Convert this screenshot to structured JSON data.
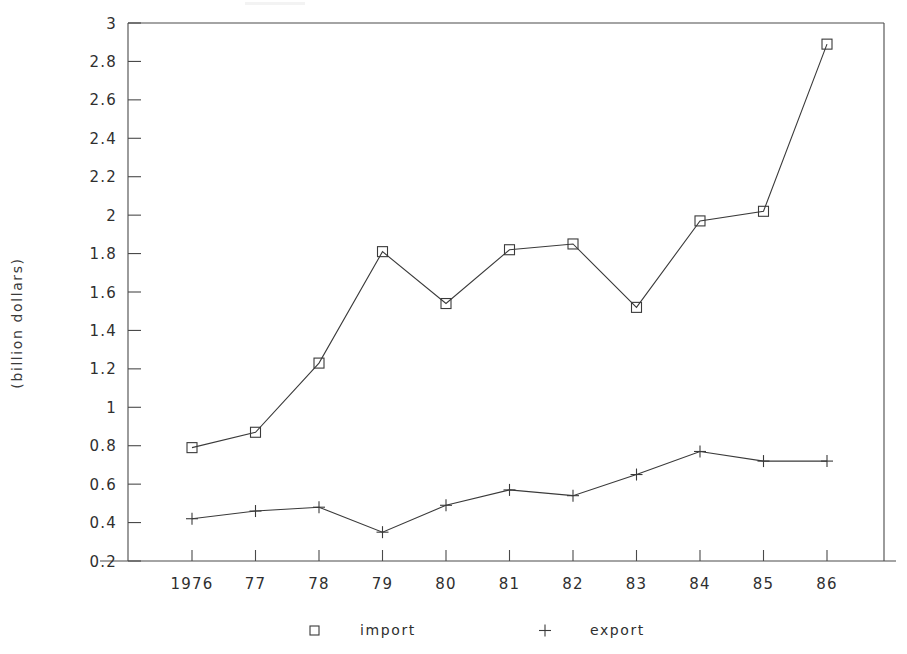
{
  "chart_data": {
    "type": "line",
    "title": "",
    "xlabel": "",
    "ylabel": "(billion dollars)",
    "categories": [
      "1976",
      "77",
      "78",
      "79",
      "80",
      "81",
      "82",
      "83",
      "84",
      "85",
      "86"
    ],
    "x_values": [
      1976,
      1977,
      1978,
      1979,
      1980,
      1981,
      1982,
      1983,
      1984,
      1985,
      1986
    ],
    "series": [
      {
        "name": "import",
        "marker": "square",
        "values": [
          0.79,
          0.87,
          1.23,
          1.81,
          1.54,
          1.82,
          1.85,
          1.52,
          1.97,
          2.02,
          2.89
        ]
      },
      {
        "name": "export",
        "marker": "plus",
        "values": [
          0.42,
          0.46,
          0.48,
          0.35,
          0.49,
          0.57,
          0.54,
          0.65,
          0.77,
          0.72,
          0.72
        ]
      }
    ],
    "ylim": [
      0.2,
      3.0
    ],
    "y_ticks": [
      "0.2",
      "0.4",
      "0.6",
      "0.8",
      "1",
      "1.2",
      "1.4",
      "1.6",
      "1.8",
      "2",
      "2.2",
      "2.4",
      "2.6",
      "2.8",
      "3"
    ],
    "y_tick_values": [
      0.2,
      0.4,
      0.6,
      0.8,
      1.0,
      1.2,
      1.4,
      1.6,
      1.8,
      2.0,
      2.2,
      2.4,
      2.6,
      2.8,
      3.0
    ],
    "grid": false,
    "legend_position": "bottom",
    "colors": {
      "line": "#3a3a3a",
      "axis": "#4a4a4a",
      "text": "#2f2f2f",
      "background": "#ffffff"
    }
  },
  "legend": {
    "entries": [
      {
        "label": "import",
        "marker": "square"
      },
      {
        "label": "export",
        "marker": "plus"
      }
    ]
  },
  "axis": {
    "y_label": "(billion dollars)"
  }
}
